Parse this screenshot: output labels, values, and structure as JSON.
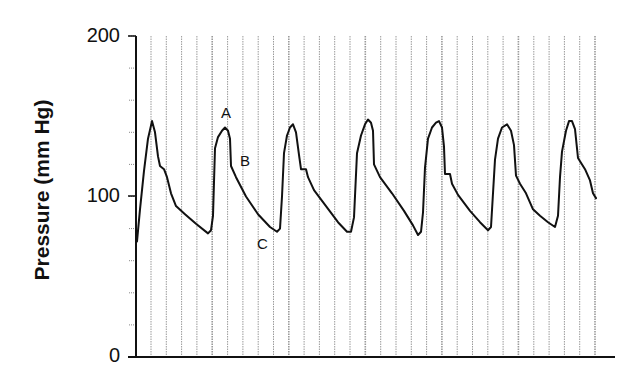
{
  "chart_data": {
    "type": "line",
    "title": "",
    "xlabel": "",
    "ylabel": "Pressure (mm Hg)",
    "ylim": [
      0,
      200
    ],
    "yticks": [
      0,
      100,
      200
    ],
    "ytick_labels": [
      "0",
      "100",
      "200"
    ],
    "y_minor_tick_step": 20,
    "grid": {
      "vertical": true,
      "horizontal": false,
      "vertical_line_count": 30
    },
    "legend": null,
    "annotations": [
      {
        "label": "A",
        "description": "systolic peak",
        "approx_pressure": 143
      },
      {
        "label": "B",
        "description": "dicrotic notch region",
        "approx_pressure": 119
      },
      {
        "label": "C",
        "description": "diastolic minimum",
        "approx_pressure": 78
      }
    ],
    "series": [
      {
        "name": "Arterial pressure waveform",
        "cycles": 7,
        "peaks_mmHg": [
          147,
          143,
          145,
          147,
          146,
          144,
          147
        ],
        "troughs_mmHg": [
          77,
          78,
          77,
          76,
          79,
          81
        ],
        "start_mmHg": 72,
        "end_mmHg": 99,
        "points_px_x_mmHg": [
          [
            137,
            72
          ],
          [
            140,
            92
          ],
          [
            144,
            116
          ],
          [
            148,
            136
          ],
          [
            152,
            147
          ],
          [
            155,
            140
          ],
          [
            158,
            125
          ],
          [
            160,
            119
          ],
          [
            164,
            117
          ],
          [
            167,
            112
          ],
          [
            171,
            102
          ],
          [
            176,
            94
          ],
          [
            185,
            89
          ],
          [
            196,
            83
          ],
          [
            208,
            77
          ],
          [
            211,
            79
          ],
          [
            213,
            88
          ],
          [
            215,
            130
          ],
          [
            218,
            137
          ],
          [
            222,
            141
          ],
          [
            225,
            143
          ],
          [
            228,
            141
          ],
          [
            230,
            136
          ],
          [
            231,
            119
          ],
          [
            236,
            112
          ],
          [
            246,
            100
          ],
          [
            258,
            89
          ],
          [
            270,
            81
          ],
          [
            277,
            78
          ],
          [
            280,
            80
          ],
          [
            282,
            100
          ],
          [
            284,
            127
          ],
          [
            287,
            138
          ],
          [
            290,
            143
          ],
          [
            293,
            145
          ],
          [
            296,
            140
          ],
          [
            299,
            126
          ],
          [
            301,
            117
          ],
          [
            306,
            117
          ],
          [
            308,
            112
          ],
          [
            314,
            104
          ],
          [
            326,
            94
          ],
          [
            338,
            84
          ],
          [
            347,
            78
          ],
          [
            351,
            78
          ],
          [
            354,
            87
          ],
          [
            357,
            127
          ],
          [
            361,
            138
          ],
          [
            365,
            145
          ],
          [
            368,
            148
          ],
          [
            371,
            146
          ],
          [
            373,
            141
          ],
          [
            374,
            120
          ],
          [
            380,
            112
          ],
          [
            392,
            102
          ],
          [
            404,
            91
          ],
          [
            413,
            82
          ],
          [
            418,
            76
          ],
          [
            421,
            78
          ],
          [
            423,
            90
          ],
          [
            425,
            118
          ],
          [
            428,
            136
          ],
          [
            432,
            143
          ],
          [
            436,
            146
          ],
          [
            439,
            147
          ],
          [
            442,
            143
          ],
          [
            444,
            131
          ],
          [
            445,
            114
          ],
          [
            450,
            114
          ],
          [
            452,
            108
          ],
          [
            458,
            101
          ],
          [
            470,
            91
          ],
          [
            480,
            84
          ],
          [
            488,
            79
          ],
          [
            491,
            81
          ],
          [
            493,
            102
          ],
          [
            495,
            123
          ],
          [
            498,
            136
          ],
          [
            502,
            143
          ],
          [
            507,
            145
          ],
          [
            511,
            141
          ],
          [
            514,
            132
          ],
          [
            516,
            113
          ],
          [
            520,
            108
          ],
          [
            526,
            102
          ],
          [
            533,
            92
          ],
          [
            540,
            88
          ],
          [
            548,
            84
          ],
          [
            555,
            81
          ],
          [
            558,
            88
          ],
          [
            560,
            112
          ],
          [
            562,
            128
          ],
          [
            566,
            141
          ],
          [
            569,
            147
          ],
          [
            572,
            147
          ],
          [
            575,
            142
          ],
          [
            578,
            124
          ],
          [
            580,
            122
          ],
          [
            585,
            117
          ],
          [
            590,
            110
          ],
          [
            593,
            102
          ],
          [
            596,
            99
          ]
        ]
      }
    ]
  },
  "axes": {
    "ylabel": "Pressure (mm Hg)",
    "ytick_200": "200",
    "ytick_100": "100",
    "ytick_0": "0"
  },
  "annotations": {
    "a": "A",
    "b": "B",
    "c": "C"
  },
  "style": {
    "line_color": "#111111",
    "grid_color": "#9a9a9a",
    "axis_color": "#111111"
  }
}
